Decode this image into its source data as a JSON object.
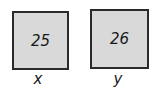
{
  "boxes": [
    {
      "value": "25",
      "label": "x"
    },
    {
      "value": "26",
      "label": "y"
    }
  ],
  "colors": {
    "box_fill": "#d9d9d9",
    "box_border": "#2a2a2a",
    "text": "#1a1a1a"
  }
}
